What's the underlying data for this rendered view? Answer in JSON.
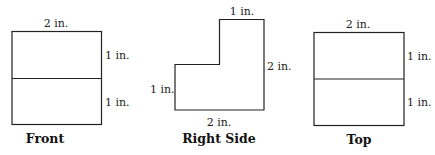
{
  "views": {
    "front": {
      "caption": "Front",
      "top_label": "2 in.",
      "right_upper_label": "1 in.",
      "right_lower_label": "1 in."
    },
    "right_side": {
      "caption": "Right Side",
      "top_label": "1 in.",
      "right_label": "2 in.",
      "left_label": "1 in.",
      "bottom_label": "2 in."
    },
    "top": {
      "caption": "Top",
      "top_label": "2 in.",
      "right_upper_label": "1 in.",
      "right_lower_label": "1 in."
    }
  }
}
